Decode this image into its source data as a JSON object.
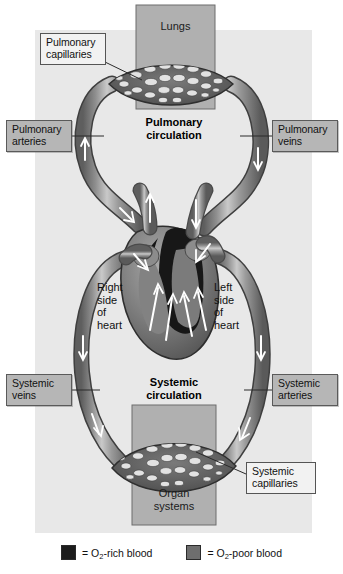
{
  "figure": {
    "background_color": "#e8e8e8",
    "page_background": "#ffffff"
  },
  "regions": [
    {
      "name": "lungs",
      "label": "Lungs",
      "fill": "#b0b0b0"
    },
    {
      "name": "organ-systems",
      "label": "Organ\nsystems",
      "fill": "#b0b0b0"
    }
  ],
  "circuits": [
    {
      "name": "pulmonary",
      "title": "Pulmonary\ncirculation"
    },
    {
      "name": "systemic",
      "title": "Systemic\ncirculation"
    }
  ],
  "heart_labels": [
    {
      "name": "right-side-of-heart",
      "text": "Right\nside\nof\nheart"
    },
    {
      "name": "left-side-of-heart",
      "text": "Left\nside\nof\nheart"
    }
  ],
  "callouts": [
    {
      "name": "pulmonary-capillaries",
      "label": "Pulmonary\ncapillaries",
      "style": "white"
    },
    {
      "name": "pulmonary-arteries",
      "label": "Pulmonary\narteries",
      "style": "gray"
    },
    {
      "name": "pulmonary-veins",
      "label": "Pulmonary\nveins",
      "style": "gray"
    },
    {
      "name": "systemic-veins",
      "label": "Systemic\nveins",
      "style": "gray"
    },
    {
      "name": "systemic-arteries",
      "label": "Systemic\narteries",
      "style": "gray"
    },
    {
      "name": "systemic-capillaries",
      "label": "Systemic\ncapillaries",
      "style": "white"
    }
  ],
  "legend": {
    "items": [
      {
        "name": "o2-rich-blood",
        "equals": "=",
        "prefix": "O",
        "sub": "2",
        "suffix": "-rich blood",
        "color": "#1c1c1c"
      },
      {
        "name": "o2-poor-blood",
        "equals": "=",
        "prefix": "O",
        "sub": "2",
        "suffix": "-poor blood",
        "color": "#6e6e6e"
      }
    ]
  },
  "colors": {
    "oxygen_rich": "#1c1c1c",
    "oxygen_poor": "#6e6e6e",
    "vessel_mid": "#8a8a8a",
    "vessel_light": "#c6c6c6",
    "vessel_dark": "#4a4a4a",
    "panel": "#e8e8e8",
    "box_gray": "#b6b6b6",
    "outline": "#333333",
    "arrow": "#ffffff"
  }
}
